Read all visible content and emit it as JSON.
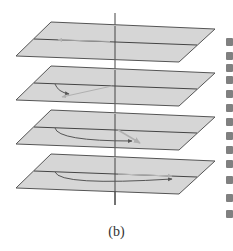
{
  "figure": {
    "caption": "(b)",
    "colors": {
      "plane_fill": "#d6d6d6",
      "plane_edge": "#555555",
      "axis": "#444444",
      "arrow": "#555555",
      "faint_arrow": "#b0b0b0",
      "background": "#ffffff"
    },
    "axis": {
      "x": 115,
      "y_top": 13,
      "y_bottom": 205
    },
    "planes": [
      {
        "index": 1,
        "points": "51,22 215,29 179,62 16,56",
        "midline": [
          34,
          39,
          197,
          45
        ],
        "arrow": "straight-left"
      },
      {
        "index": 2,
        "points": "51,66 215,73 179,106 16,100",
        "midline": [
          34,
          83,
          197,
          89
        ],
        "arrow": "short-curve"
      },
      {
        "index": 3,
        "points": "51,110 215,117 179,150 16,144",
        "midline": [
          34,
          127,
          197,
          133
        ],
        "arrow": "medium-curve"
      },
      {
        "index": 4,
        "points": "51,154 215,161 179,194 16,188",
        "midline": [
          34,
          171,
          197,
          177
        ],
        "arrow": "long-curve"
      }
    ]
  },
  "margin_text_fragments": [
    38,
    52,
    64,
    76,
    90,
    104,
    118,
    132,
    146,
    160,
    176,
    194,
    210
  ]
}
